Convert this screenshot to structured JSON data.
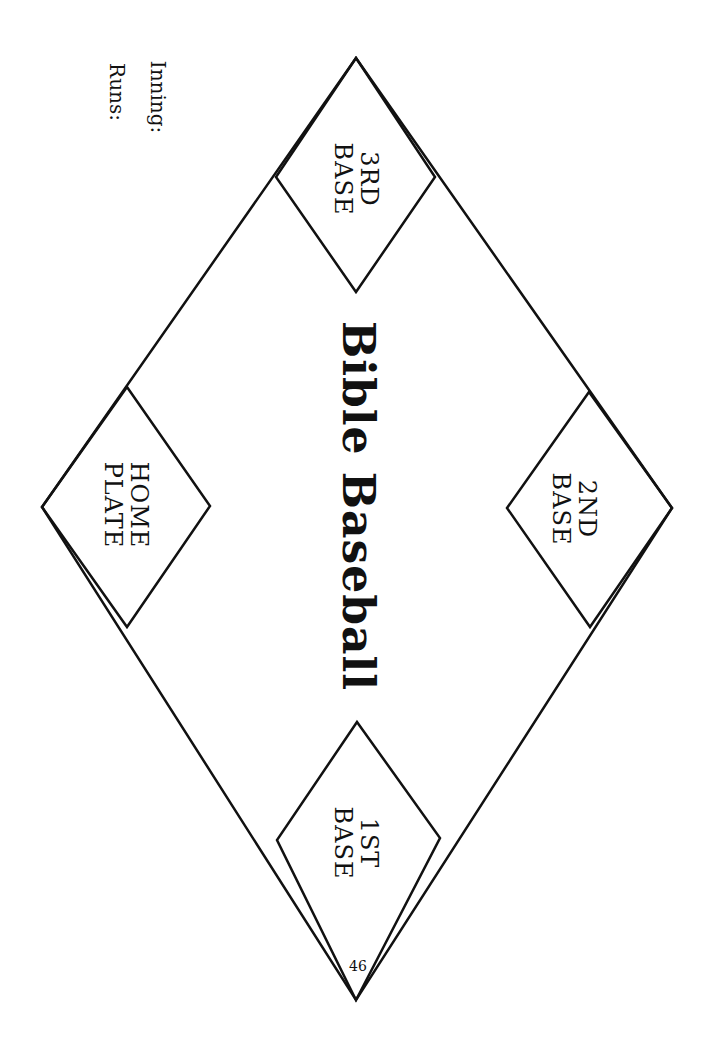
{
  "title": "Bible Baseball",
  "bases": {
    "home": {
      "line1": "HOME",
      "line2": "PLATE"
    },
    "first": {
      "line1": "1ST",
      "line2": "BASE"
    },
    "second": {
      "line1": "2ND",
      "line2": "BASE"
    },
    "third": {
      "line1": "3RD",
      "line2": "BASE"
    }
  },
  "scoreboard": {
    "inning_label": "Inning:",
    "runs_label": "Runs:"
  },
  "page_number": "46",
  "colors": {
    "line": "#111111",
    "background": "#ffffff"
  }
}
